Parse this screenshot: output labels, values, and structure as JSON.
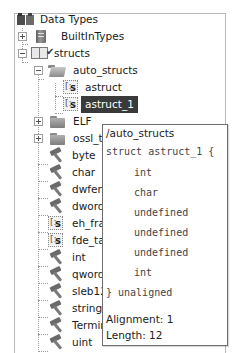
{
  "tree": {
    "root": {
      "label": "Data Types",
      "icon": "data-types-icon"
    },
    "items": [
      {
        "label": "BuiltInTypes",
        "icon": "book-icon",
        "level": 1,
        "toggle": "plus"
      },
      {
        "label": "structs",
        "icon": "archive-icon",
        "level": 1,
        "toggle": "minus"
      },
      {
        "label": "auto_structs",
        "icon": "folder-open-icon",
        "level": 2,
        "toggle": "minus"
      },
      {
        "label": "astruct",
        "icon": "struct-icon",
        "level": 3
      },
      {
        "label": "astruct_1",
        "icon": "struct-icon",
        "level": 3,
        "selected": true
      },
      {
        "label": "ELF",
        "icon": "folder-icon",
        "level": 2,
        "toggle": "plus"
      },
      {
        "label": "ossl_typ",
        "icon": "folder-icon",
        "level": 2,
        "toggle": "plus"
      },
      {
        "label": "byte",
        "icon": "builtin-icon",
        "level": 2
      },
      {
        "label": "char",
        "icon": "builtin-icon",
        "level": 2
      },
      {
        "label": "dwfenc",
        "icon": "builtin-icon",
        "level": 2
      },
      {
        "label": "dword",
        "icon": "builtin-icon",
        "level": 2
      },
      {
        "label": "eh_fram",
        "icon": "struct-icon",
        "level": 2
      },
      {
        "label": "fde_tab",
        "icon": "struct-icon",
        "level": 2
      },
      {
        "label": "int",
        "icon": "builtin-icon",
        "level": 2
      },
      {
        "label": "qword",
        "icon": "builtin-icon",
        "level": 2
      },
      {
        "label": "sleb128",
        "icon": "builtin-icon",
        "level": 2
      },
      {
        "label": "string",
        "icon": "builtin-icon",
        "level": 2
      },
      {
        "label": "Termina",
        "icon": "builtin-icon",
        "level": 2
      },
      {
        "label": "uint",
        "icon": "builtin-icon",
        "level": 2
      }
    ]
  },
  "tooltip": {
    "path": "/auto_structs",
    "header": "struct astruct_1 {",
    "fields": [
      "int",
      "char",
      "undefined",
      "undefined",
      "undefined",
      "int"
    ],
    "footer": "} unaligned",
    "alignment": "Alignment: 1",
    "length": "Length: 12"
  }
}
